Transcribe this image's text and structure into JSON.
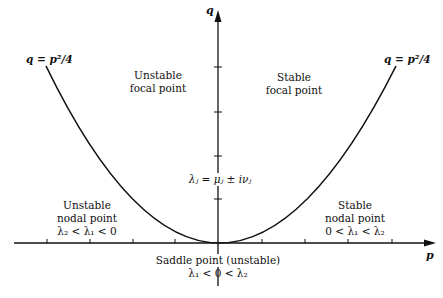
{
  "diagram": {
    "type": "stability-diagram",
    "axes": {
      "x_label": "p",
      "y_label": "q"
    },
    "curve": {
      "equation_left": "q = p²/4",
      "equation_right": "q = p²/4",
      "shape": "parabola"
    },
    "regions": {
      "unstable_focal": {
        "line1": "Unstable",
        "line2": "focal point"
      },
      "stable_focal": {
        "line1": "Stable",
        "line2": "focal point"
      },
      "unstable_nodal": {
        "line1": "Unstable",
        "line2": "nodal point",
        "condition": "λ₂ < λ₁ < 0"
      },
      "stable_nodal": {
        "line1": "Stable",
        "line2": "nodal point",
        "condition": "0 < λ₁ < λ₂"
      },
      "saddle": {
        "line1": "Saddle point (unstable)",
        "condition": "λ₁ < 0 < λ₂"
      }
    },
    "eigen_expression": "λⱼ = μⱼ ± iνⱼ",
    "colors": {
      "ink": "#111111",
      "background": "#ffffff"
    }
  }
}
